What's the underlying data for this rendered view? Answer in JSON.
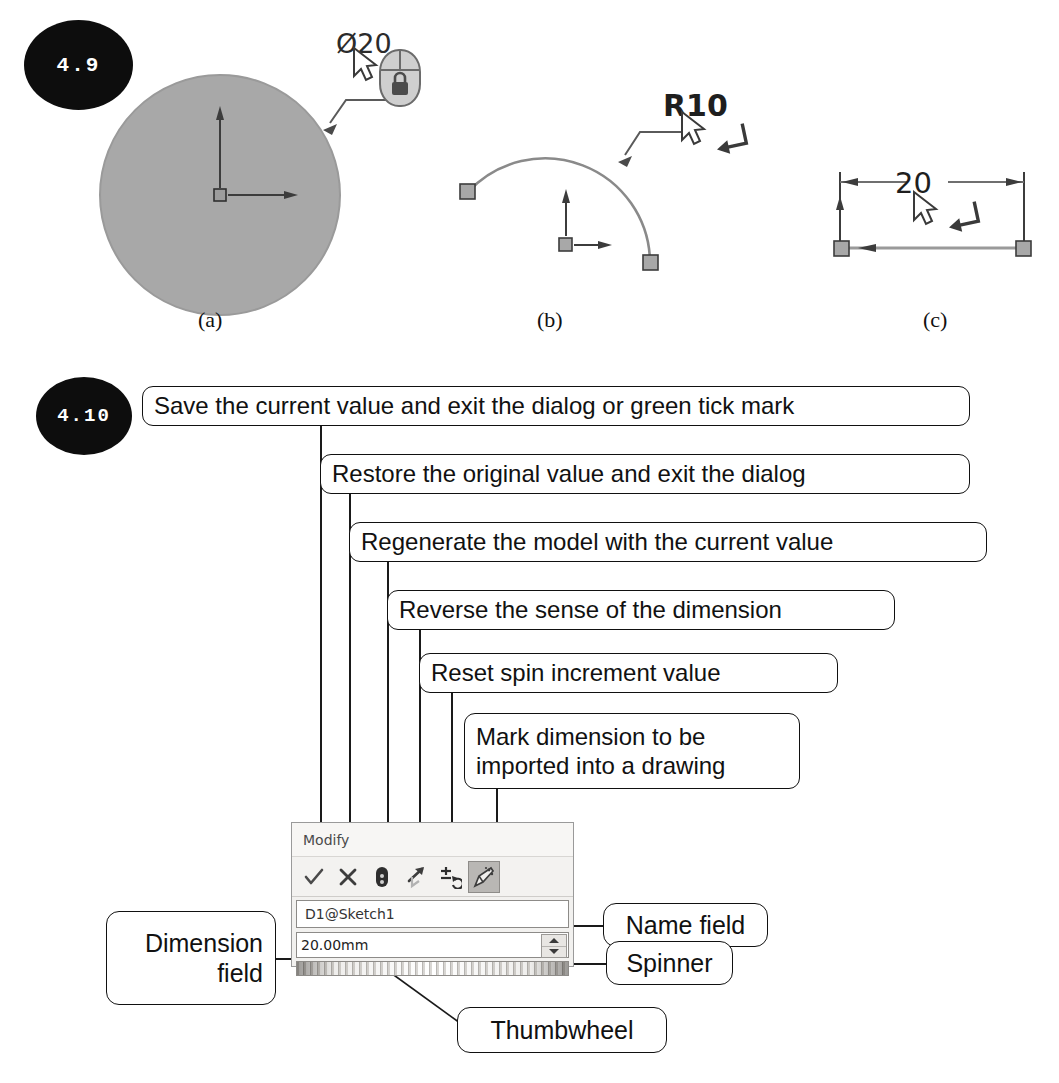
{
  "figures": {
    "fig49": {
      "number": "4.9",
      "captions": [
        {
          "key": "a",
          "label": "(a)"
        },
        {
          "key": "b",
          "label": "(b)"
        },
        {
          "key": "c",
          "label": "(c)"
        }
      ],
      "annotations": {
        "circle_dimension": "Ø20",
        "arc_dimension": "R10",
        "line_dimension": "20"
      },
      "icons": {
        "cursor": "mouse-pointer-icon",
        "mouse_lock": "mouse-with-lock-icon",
        "return_arrow": "return-key-icon"
      },
      "colors": {
        "shaded_fill": "#a6a6a6",
        "geometry_stroke": "#6e6e6e",
        "point_marker": "#8c8c8c",
        "axis_stroke": "#444444"
      }
    },
    "fig410": {
      "number": "4.10",
      "callouts": [
        {
          "id": "save",
          "text": "Save the current value and exit the dialog or green tick mark"
        },
        {
          "id": "restore",
          "text": "Restore the original value and exit the dialog"
        },
        {
          "id": "regen",
          "text": "Regenerate the model with the current value"
        },
        {
          "id": "reverse",
          "text": "Reverse the sense of the dimension"
        },
        {
          "id": "reset",
          "text": "Reset spin increment value"
        },
        {
          "id": "mark",
          "text": "Mark dimension to be imported into a drawing"
        }
      ],
      "side_labels": [
        {
          "id": "name-field",
          "text": "Name field"
        },
        {
          "id": "spinner",
          "text": "Spinner"
        },
        {
          "id": "thumbwheel",
          "text": "Thumbwheel"
        },
        {
          "id": "dimension-field",
          "text": "Dimension\nfield"
        }
      ],
      "dialog": {
        "title": "Modify",
        "name_field_value": "D1@Sketch1",
        "dimension_value": "20.00mm",
        "toolbar_buttons": [
          {
            "id": "accept",
            "icon": "check-icon",
            "label": "Save the current value and exit the dialog",
            "active": false
          },
          {
            "id": "cancel",
            "icon": "cross-icon",
            "label": "Restore the original value and exit the dialog",
            "active": false
          },
          {
            "id": "rebuild",
            "icon": "rebuild-icon",
            "label": "Regenerate the model with the current value",
            "active": false
          },
          {
            "id": "reverse",
            "icon": "reverse-arrow-icon",
            "label": "Reverse the sense of the dimension",
            "active": false
          },
          {
            "id": "reset",
            "icon": "reset-increment-icon",
            "label": "Reset spin increment value",
            "active": false
          },
          {
            "id": "mark",
            "icon": "mark-for-drawing-icon",
            "label": "Mark dimension to be imported into a drawing",
            "active": true
          }
        ],
        "spinner": {
          "up": "spinner-up-arrow",
          "down": "spinner-down-arrow"
        }
      },
      "colors": {
        "dialog_bg": "#f2f1ef",
        "dialog_border": "#9a9a9a",
        "active_button_bg": "#b9b7b4",
        "callout_border": "#111111",
        "badge_bg": "#0d0d0d"
      }
    }
  }
}
